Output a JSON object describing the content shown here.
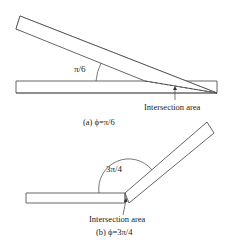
{
  "panel_a": {
    "angle_label": "π/6",
    "intersection_label": "Intersection area",
    "caption": "(a) ϕ=π/6",
    "angle_value": "π/6"
  },
  "panel_b": {
    "angle_label": "3π/4",
    "intersection_label": "Intersection area",
    "caption": "(b) ϕ=3π/4",
    "angle_value": "3π/4"
  },
  "colors": {
    "stroke": "#555555",
    "text": "#222222",
    "background": "#ffffff"
  }
}
